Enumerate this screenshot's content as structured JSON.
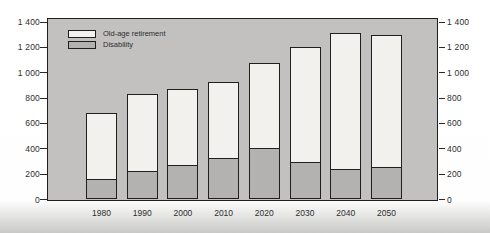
{
  "figure": {
    "page_background": "#ffffff",
    "plot_background": "#c2c1c0",
    "frame_color": "#1f1f1f",
    "text_color": "#2e2e2e"
  },
  "legend": {
    "items": [
      {
        "label": "Old-age retirement",
        "color": "#f2f1ed"
      },
      {
        "label": "Disability",
        "color": "#b3b2b0"
      }
    ]
  },
  "chart_data": {
    "type": "bar",
    "stacked": true,
    "title": "",
    "xlabel": "",
    "ylabel": "",
    "categories": [
      "1980",
      "1990",
      "2000",
      "2010",
      "2020",
      "2030",
      "2040",
      "2050"
    ],
    "series": [
      {
        "name": "Disability",
        "color": "#b3b2b0",
        "values": [
          155,
          220,
          270,
          320,
          400,
          295,
          240,
          250
        ]
      },
      {
        "name": "Old-age retirement",
        "color": "#f2f1ed",
        "values": [
          525,
          615,
          600,
          610,
          680,
          905,
          1070,
          1050
        ]
      }
    ],
    "stack_totals": [
      680,
      835,
      870,
      930,
      1080,
      1200,
      1310,
      1300
    ],
    "ylim": [
      0,
      1400
    ],
    "yticks": [
      0,
      200,
      400,
      600,
      800,
      1000,
      1200,
      1400
    ],
    "ytick_labels": [
      "0",
      "200",
      "400",
      "600",
      "800",
      "1 000",
      "1 200",
      "1 400"
    ],
    "grid": false,
    "dual_y_axis": true,
    "legend_position": "upper-left-inside",
    "frame_top_value": 1420
  }
}
